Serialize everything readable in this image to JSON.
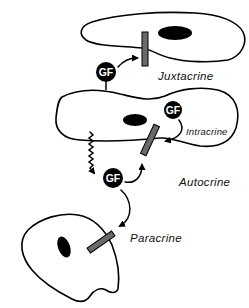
{
  "diagram": {
    "colors": {
      "line": "#000000",
      "receptor_fill": "#6a6a6a",
      "nucleus_fill": "#000000",
      "gf_fill": "#000000",
      "gf_text": "#ffffff",
      "background": "#ffffff"
    },
    "molecule_label": "GF",
    "labels": {
      "juxtacrine": "Juxtacrine",
      "intracrine": "Intracrine",
      "autocrine": "Autocrine",
      "paracrine": "Paracrine"
    },
    "cells": [
      {
        "name": "top-target-cell",
        "role": "juxtacrine target"
      },
      {
        "name": "middle-producing-cell",
        "role": "growth factor producer"
      },
      {
        "name": "bottom-target-cell",
        "role": "paracrine target"
      }
    ],
    "icons": {
      "receptor": "receptor-bar",
      "growth_factor": "gf-circle",
      "secretion": "wavy-arrow",
      "binding": "curved-arrow"
    }
  }
}
